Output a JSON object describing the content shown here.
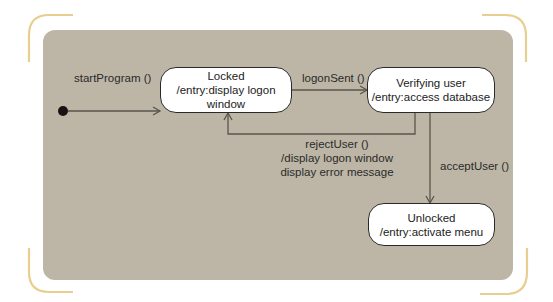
{
  "diagram": {
    "type": "state-machine",
    "colors": {
      "panel": "#bdb6a6",
      "bracket": "#e8cf8f",
      "state_fill": "#ffffff",
      "line": "#555048"
    },
    "initial": {
      "transition": "startProgram ()"
    },
    "states": [
      {
        "id": "locked",
        "name": "Locked",
        "action": "/entry:display logon window"
      },
      {
        "id": "verifying",
        "name": "Verifying user",
        "action": "/entry:access database"
      },
      {
        "id": "unlocked",
        "name": "Unlocked",
        "action": "/entry:activate menu"
      }
    ],
    "transitions": [
      {
        "from": "initial",
        "to": "locked",
        "label": "startProgram ()"
      },
      {
        "from": "locked",
        "to": "verifying",
        "label": "logonSent ()"
      },
      {
        "from": "verifying",
        "to": "locked",
        "label": "rejectUser ()",
        "action_lines": [
          "/display logon window",
          "display error message"
        ]
      },
      {
        "from": "verifying",
        "to": "unlocked",
        "label": "acceptUser ()"
      }
    ]
  }
}
